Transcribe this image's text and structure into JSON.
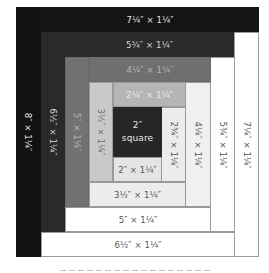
{
  "diagram": {
    "type": "log-cabin-quilt-block",
    "colors": {
      "black": "#111111",
      "very_dark": "#141414",
      "dark": "#2a2a2a",
      "medium": "#707070",
      "light_medium": "#b5b5b5",
      "light": "#c9c9c9",
      "very_light": "#ececec",
      "pale": "#e4e4e4",
      "white": "#ffffff",
      "center": "#262626"
    },
    "center": {
      "line1": "2″",
      "line2": "square"
    },
    "strips": [
      {
        "id": "s1",
        "label": "2″ × 1¼″",
        "orientation": "horizontal",
        "position": "bottom"
      },
      {
        "id": "s2",
        "label": "2¾″ × 1¼″",
        "orientation": "vertical",
        "position": "right"
      },
      {
        "id": "s3",
        "label": "2¾″ × 1¼″",
        "orientation": "horizontal",
        "position": "top"
      },
      {
        "id": "s4",
        "label": "3½″ × 1¼″",
        "orientation": "vertical",
        "position": "left"
      },
      {
        "id": "s5",
        "label": "3½″ × 1¼″",
        "orientation": "horizontal",
        "position": "bottom"
      },
      {
        "id": "s6",
        "label": "4¼″ × 1¼″",
        "orientation": "vertical",
        "position": "right"
      },
      {
        "id": "s7",
        "label": "4¼″ × 1¼″",
        "orientation": "horizontal",
        "position": "top"
      },
      {
        "id": "s8",
        "label": "5″ × 1¼″",
        "orientation": "vertical",
        "position": "left"
      },
      {
        "id": "s9",
        "label": "5″ × 1¼″",
        "orientation": "horizontal",
        "position": "bottom"
      },
      {
        "id": "s10",
        "label": "5¾″ × 1¼″",
        "orientation": "vertical",
        "position": "right"
      },
      {
        "id": "s11",
        "label": "5¾″ × 1¼″",
        "orientation": "horizontal",
        "position": "top"
      },
      {
        "id": "s12",
        "label": "6½″ × 1¼″",
        "orientation": "vertical",
        "position": "left"
      },
      {
        "id": "s13",
        "label": "6½″ × 1¼″",
        "orientation": "horizontal",
        "position": "bottom"
      },
      {
        "id": "s14",
        "label": "7¼″ × 1¼″",
        "orientation": "vertical",
        "position": "right"
      },
      {
        "id": "s15",
        "label": "7¼″ × 1¼″",
        "orientation": "horizontal",
        "position": "top"
      },
      {
        "id": "s16",
        "label": "8″ × 1¼″",
        "orientation": "vertical",
        "position": "left"
      }
    ]
  }
}
